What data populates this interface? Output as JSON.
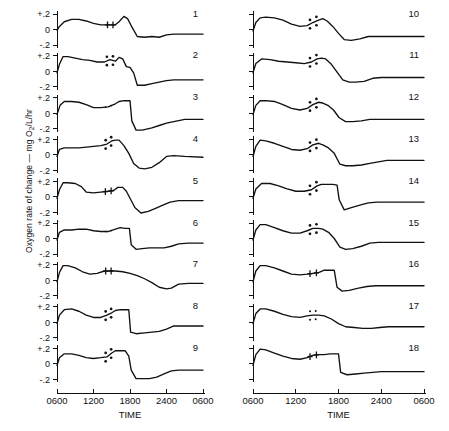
{
  "figure": {
    "y_axis_title": "Oxygen rate of change — mg O",
    "y_axis_title_sub": "2",
    "y_axis_title_tail": "/L/hr",
    "x_axis_title": "TIME",
    "y_ticks": [
      "+.2",
      "0",
      "-.2"
    ],
    "x_ticks": [
      "0600",
      "1200",
      "1800",
      "2400",
      "0600"
    ],
    "stroke_color": "#111111",
    "background_color": "#ffffff"
  },
  "chart_data": {
    "type": "line",
    "title": "",
    "xlabel": "TIME",
    "ylabel": "Oxygen rate of change — mg O2/L/hr",
    "xlim": [
      600,
      3000
    ],
    "ylim": [
      -0.3,
      0.3
    ],
    "x_tick_values": [
      600,
      1200,
      1800,
      2400,
      3000
    ],
    "x_tick_labels": [
      "0600",
      "1200",
      "1800",
      "2400",
      "0600"
    ],
    "y_tick_values": [
      0.2,
      0,
      -0.2
    ],
    "y_tick_labels": [
      "+.2",
      "0",
      "-.2"
    ],
    "grid": false,
    "legend": "none",
    "layout": {
      "columns": 2,
      "rows": 9,
      "panels_per_column": 9
    },
    "marker_types": {
      "dots": "four-dot 2x2 cluster straddling trace",
      "cross": "pair of cross/plus marks on trace"
    },
    "series": [
      {
        "name": "1",
        "column": 1,
        "marker": "cross",
        "marker_x": [
          1430,
          1520
        ],
        "x": [
          600,
          640,
          720,
          840,
          960,
          1080,
          1200,
          1320,
          1440,
          1560,
          1620,
          1700,
          1760,
          1840,
          1920,
          2040,
          2160,
          2280,
          2400,
          2520,
          2640,
          2760,
          3000
        ],
        "y": [
          -0.01,
          0.04,
          0.1,
          0.13,
          0.13,
          0.11,
          0.08,
          0.06,
          0.06,
          0.06,
          0.1,
          0.17,
          0.14,
          0.02,
          -0.09,
          -0.1,
          -0.09,
          -0.1,
          -0.07,
          -0.06,
          -0.06,
          -0.06,
          -0.06
        ]
      },
      {
        "name": "2",
        "column": 1,
        "marker": "dots",
        "marker_x": [
          1420,
          1520
        ],
        "x": [
          600,
          640,
          700,
          780,
          900,
          1020,
          1140,
          1260,
          1380,
          1470,
          1560,
          1620,
          1680,
          1740,
          1800,
          1860,
          1920,
          2040,
          2160,
          2280,
          2400,
          2520,
          2700,
          3000
        ],
        "y": [
          -0.02,
          0.09,
          0.19,
          0.19,
          0.17,
          0.15,
          0.14,
          0.12,
          0.12,
          0.15,
          0.13,
          0.18,
          0.16,
          0.06,
          0.05,
          -0.02,
          -0.18,
          -0.18,
          -0.16,
          -0.14,
          -0.12,
          -0.11,
          -0.11,
          -0.11
        ]
      },
      {
        "name": "3",
        "column": 1,
        "marker": "dots-faint",
        "marker_x": [
          1400,
          1490
        ],
        "x": [
          600,
          650,
          720,
          840,
          960,
          1080,
          1200,
          1320,
          1440,
          1560,
          1620,
          1700,
          1760,
          1800,
          1830,
          1900,
          2000,
          2160,
          2280,
          2400,
          2520,
          2700,
          3000
        ],
        "y": [
          -0.02,
          0.1,
          0.15,
          0.15,
          0.14,
          0.11,
          0.07,
          0.07,
          0.08,
          0.12,
          0.15,
          0.16,
          0.16,
          0.16,
          -0.1,
          -0.22,
          -0.22,
          -0.19,
          -0.16,
          -0.13,
          -0.11,
          -0.08,
          -0.08
        ]
      },
      {
        "name": "4",
        "column": 1,
        "marker": "dots",
        "marker_x": [
          1400,
          1490
        ],
        "x": [
          600,
          640,
          720,
          840,
          960,
          1080,
          1200,
          1320,
          1420,
          1500,
          1560,
          1620,
          1700,
          1780,
          1860,
          1950,
          2040,
          2160,
          2280,
          2400,
          2520,
          2700,
          3000
        ],
        "y": [
          -0.02,
          0.07,
          0.09,
          0.09,
          0.09,
          0.1,
          0.11,
          0.12,
          0.14,
          0.18,
          0.19,
          0.19,
          0.12,
          0.02,
          -0.11,
          -0.17,
          -0.18,
          -0.16,
          -0.1,
          -0.02,
          -0.01,
          -0.02,
          -0.03
        ]
      },
      {
        "name": "5",
        "column": 1,
        "marker": "cross",
        "marker_x": [
          1395,
          1490
        ],
        "x": [
          600,
          640,
          700,
          780,
          900,
          1000,
          1080,
          1200,
          1320,
          1440,
          1530,
          1600,
          1680,
          1740,
          1800,
          1880,
          1980,
          2100,
          2220,
          2340,
          2460,
          2600,
          2760,
          3000
        ],
        "y": [
          -0.02,
          0.09,
          0.18,
          0.18,
          0.17,
          0.13,
          0.06,
          0.05,
          0.06,
          0.07,
          0.08,
          0.12,
          0.12,
          0.07,
          -0.02,
          -0.14,
          -0.21,
          -0.19,
          -0.15,
          -0.11,
          -0.07,
          -0.05,
          -0.05,
          -0.05
        ]
      },
      {
        "name": "6",
        "column": 1,
        "marker": "dots-faint",
        "marker_x": [
          1400,
          1490
        ],
        "x": [
          600,
          640,
          720,
          840,
          960,
          1080,
          1200,
          1320,
          1440,
          1560,
          1640,
          1720,
          1790,
          1820,
          1900,
          2000,
          2120,
          2240,
          2360,
          2480,
          2600,
          2760,
          3000
        ],
        "y": [
          -0.02,
          0.08,
          0.11,
          0.11,
          0.12,
          0.12,
          0.1,
          0.09,
          0.09,
          0.12,
          0.14,
          0.13,
          0.13,
          -0.08,
          -0.14,
          -0.13,
          -0.12,
          -0.12,
          -0.12,
          -0.1,
          -0.07,
          -0.06,
          -0.06
        ]
      },
      {
        "name": "7",
        "column": 1,
        "marker": "cross",
        "marker_x": [
          1400,
          1490
        ],
        "x": [
          600,
          640,
          700,
          780,
          900,
          1020,
          1140,
          1260,
          1380,
          1460,
          1560,
          1680,
          1800,
          1920,
          2040,
          2160,
          2280,
          2400,
          2480,
          2600,
          2760,
          3000
        ],
        "y": [
          -0.02,
          0.1,
          0.19,
          0.19,
          0.16,
          0.11,
          0.08,
          0.09,
          0.12,
          0.12,
          0.12,
          0.11,
          0.09,
          0.06,
          0.02,
          -0.03,
          -0.09,
          -0.11,
          -0.1,
          -0.05,
          -0.04,
          -0.04
        ]
      },
      {
        "name": "8",
        "column": 1,
        "marker": "dots",
        "marker_x": [
          1400,
          1490
        ],
        "x": [
          600,
          640,
          720,
          840,
          960,
          1080,
          1200,
          1320,
          1420,
          1500,
          1560,
          1640,
          1720,
          1780,
          1810,
          1900,
          2040,
          2160,
          2280,
          2400,
          2520,
          2700,
          3000
        ],
        "y": [
          -0.02,
          0.09,
          0.16,
          0.17,
          0.14,
          0.09,
          0.06,
          0.06,
          0.09,
          0.12,
          0.15,
          0.16,
          0.16,
          0.16,
          -0.13,
          -0.15,
          -0.14,
          -0.13,
          -0.12,
          -0.09,
          -0.05,
          -0.05,
          -0.05
        ]
      },
      {
        "name": "9",
        "column": 1,
        "marker": "dots",
        "marker_x": [
          1400,
          1490
        ],
        "x": [
          600,
          640,
          720,
          840,
          960,
          1080,
          1200,
          1320,
          1420,
          1500,
          1560,
          1640,
          1720,
          1780,
          1820,
          1900,
          2000,
          2120,
          2240,
          2360,
          2480,
          2600,
          2760,
          3000
        ],
        "y": [
          -0.02,
          0.08,
          0.13,
          0.13,
          0.11,
          0.08,
          0.07,
          0.08,
          0.09,
          0.14,
          0.17,
          0.17,
          0.17,
          0.1,
          -0.08,
          -0.19,
          -0.19,
          -0.19,
          -0.17,
          -0.13,
          -0.09,
          -0.08,
          -0.08,
          -0.08
        ]
      },
      {
        "name": "10",
        "column": 2,
        "marker": "dots",
        "marker_x": [
          1400,
          1490
        ],
        "x": [
          600,
          640,
          700,
          780,
          900,
          1020,
          1140,
          1260,
          1360,
          1440,
          1520,
          1580,
          1640,
          1720,
          1800,
          1880,
          1980,
          2100,
          2220,
          2340,
          2460,
          2600,
          2760,
          3000
        ],
        "y": [
          -0.02,
          0.09,
          0.15,
          0.16,
          0.15,
          0.12,
          0.07,
          0.04,
          0.05,
          0.09,
          0.12,
          0.14,
          0.11,
          0.04,
          -0.05,
          -0.13,
          -0.14,
          -0.12,
          -0.09,
          -0.09,
          -0.09,
          -0.09,
          -0.09,
          -0.09
        ]
      },
      {
        "name": "11",
        "column": 2,
        "marker": "dots",
        "marker_x": [
          1400,
          1490
        ],
        "x": [
          600,
          640,
          720,
          840,
          960,
          1080,
          1200,
          1320,
          1420,
          1500,
          1560,
          1620,
          1700,
          1780,
          1860,
          1950,
          2040,
          2160,
          2280,
          2400,
          2520,
          2700,
          3000
        ],
        "y": [
          -0.02,
          0.1,
          0.16,
          0.15,
          0.13,
          0.12,
          0.11,
          0.1,
          0.12,
          0.16,
          0.17,
          0.16,
          0.09,
          -0.01,
          -0.11,
          -0.14,
          -0.14,
          -0.13,
          -0.09,
          -0.08,
          -0.08,
          -0.08,
          -0.08
        ]
      },
      {
        "name": "12",
        "column": 2,
        "marker": "dots",
        "marker_x": [
          1400,
          1490
        ],
        "x": [
          600,
          640,
          700,
          780,
          900,
          1020,
          1140,
          1260,
          1360,
          1440,
          1520,
          1580,
          1650,
          1730,
          1810,
          1900,
          2000,
          2120,
          2240,
          2360,
          2480,
          2640,
          3000
        ],
        "y": [
          -0.02,
          0.1,
          0.16,
          0.16,
          0.15,
          0.11,
          0.06,
          0.04,
          0.06,
          0.11,
          0.14,
          0.13,
          0.1,
          0.04,
          -0.06,
          -0.11,
          -0.11,
          -0.1,
          -0.08,
          -0.08,
          -0.08,
          -0.08,
          -0.08
        ]
      },
      {
        "name": "13",
        "column": 2,
        "marker": "dots",
        "marker_x": [
          1400,
          1490
        ],
        "x": [
          600,
          640,
          700,
          780,
          900,
          1020,
          1140,
          1260,
          1360,
          1440,
          1520,
          1580,
          1660,
          1740,
          1820,
          1900,
          2000,
          2120,
          2240,
          2360,
          2480,
          2640,
          3000
        ],
        "y": [
          -0.02,
          0.11,
          0.19,
          0.18,
          0.15,
          0.11,
          0.07,
          0.06,
          0.08,
          0.13,
          0.15,
          0.13,
          0.09,
          0.02,
          -0.12,
          -0.14,
          -0.14,
          -0.13,
          -0.11,
          -0.09,
          -0.07,
          -0.07,
          -0.07
        ]
      },
      {
        "name": "14",
        "column": 2,
        "marker": "dots",
        "marker_x": [
          1400,
          1490
        ],
        "x": [
          600,
          640,
          720,
          840,
          960,
          1080,
          1200,
          1320,
          1420,
          1500,
          1560,
          1640,
          1720,
          1780,
          1810,
          1880,
          1980,
          2100,
          2220,
          2340,
          2460,
          2640,
          3000
        ],
        "y": [
          -0.02,
          0.1,
          0.17,
          0.17,
          0.14,
          0.1,
          0.07,
          0.07,
          0.09,
          0.14,
          0.16,
          0.16,
          0.16,
          0.15,
          -0.04,
          -0.17,
          -0.14,
          -0.11,
          -0.08,
          -0.07,
          -0.07,
          -0.07,
          -0.07
        ]
      },
      {
        "name": "15",
        "column": 2,
        "marker": "dots",
        "marker_x": [
          1400,
          1490
        ],
        "x": [
          600,
          640,
          700,
          780,
          900,
          1020,
          1140,
          1260,
          1360,
          1440,
          1520,
          1580,
          1660,
          1740,
          1820,
          1900,
          2000,
          2120,
          2240,
          2360,
          2480,
          2640,
          3000
        ],
        "y": [
          -0.02,
          0.11,
          0.18,
          0.18,
          0.14,
          0.1,
          0.07,
          0.07,
          0.1,
          0.13,
          0.13,
          0.12,
          0.08,
          0.0,
          -0.11,
          -0.14,
          -0.13,
          -0.1,
          -0.06,
          -0.05,
          -0.05,
          -0.05,
          -0.05
        ]
      },
      {
        "name": "16",
        "column": 2,
        "marker": "cross",
        "marker_x": [
          1400,
          1490
        ],
        "x": [
          600,
          640,
          700,
          780,
          900,
          1020,
          1140,
          1260,
          1360,
          1440,
          1520,
          1600,
          1680,
          1740,
          1780,
          1850,
          1950,
          2080,
          2200,
          2320,
          2460,
          2640,
          3000
        ],
        "y": [
          -0.02,
          0.12,
          0.19,
          0.19,
          0.16,
          0.12,
          0.08,
          0.07,
          0.08,
          0.09,
          0.1,
          0.13,
          0.13,
          0.13,
          -0.09,
          -0.14,
          -0.13,
          -0.1,
          -0.08,
          -0.07,
          -0.07,
          -0.07,
          -0.07
        ]
      },
      {
        "name": "17",
        "column": 2,
        "marker": "dots-small",
        "marker_x": [
          1400,
          1480
        ],
        "x": [
          600,
          640,
          700,
          780,
          900,
          1020,
          1140,
          1260,
          1360,
          1440,
          1520,
          1600,
          1700,
          1800,
          1900,
          2020,
          2140,
          2260,
          2380,
          2500,
          2640,
          2800,
          3000
        ],
        "y": [
          -0.02,
          0.11,
          0.17,
          0.17,
          0.14,
          0.1,
          0.07,
          0.06,
          0.08,
          0.09,
          0.09,
          0.08,
          0.04,
          -0.02,
          -0.06,
          -0.07,
          -0.08,
          -0.08,
          -0.07,
          -0.06,
          -0.06,
          -0.06,
          -0.06
        ]
      },
      {
        "name": "18",
        "column": 2,
        "marker": "cross",
        "marker_x": [
          1400,
          1490
        ],
        "x": [
          600,
          640,
          700,
          780,
          900,
          1020,
          1140,
          1260,
          1360,
          1440,
          1520,
          1600,
          1680,
          1760,
          1800,
          1830,
          1920,
          2040,
          2160,
          2280,
          2400,
          2560,
          2760,
          3000
        ],
        "y": [
          -0.02,
          0.12,
          0.19,
          0.18,
          0.14,
          0.1,
          0.07,
          0.06,
          0.08,
          0.11,
          0.12,
          0.12,
          0.13,
          0.13,
          0.13,
          -0.11,
          -0.14,
          -0.13,
          -0.12,
          -0.11,
          -0.1,
          -0.1,
          -0.1,
          -0.1
        ]
      }
    ]
  }
}
